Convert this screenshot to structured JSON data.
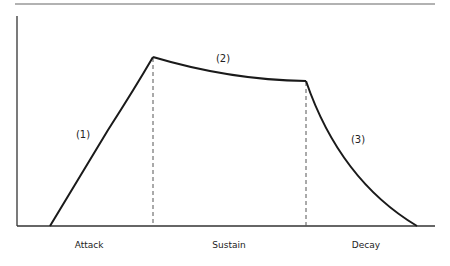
{
  "diagram": {
    "title": "",
    "segments": [
      {
        "id": "attack",
        "marker": "(1)",
        "label": "Attack"
      },
      {
        "id": "sustain",
        "marker": "(2)",
        "label": "Sustain"
      },
      {
        "id": "decay",
        "marker": "(3)",
        "label": "Decay"
      }
    ],
    "colors": {
      "curve": "#1a1a1a",
      "axis": "#333333",
      "rule": "#888888",
      "divider": "#555555"
    }
  }
}
